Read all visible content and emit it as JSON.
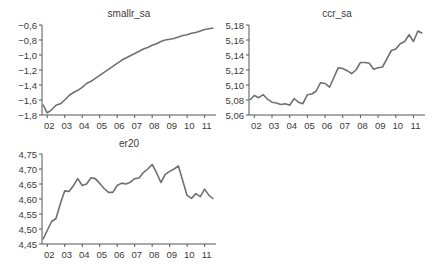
{
  "figure": {
    "panels": [
      {
        "id": "smallr_sa",
        "title": "smallr_sa"
      },
      {
        "id": "ccr_sa",
        "title": "ccr_sa"
      },
      {
        "id": "er20",
        "title": "er20"
      }
    ]
  },
  "chart_data": [
    {
      "type": "line",
      "title": "smallr_sa",
      "xlabel": "",
      "ylabel": "",
      "x_tick_labels": [
        "02",
        "03",
        "04",
        "05",
        "06",
        "07",
        "08",
        "09",
        "10",
        "11"
      ],
      "y_tick_labels": [
        "-0,6",
        "-0,8",
        "-1,0",
        "-1,2",
        "-1,4",
        "-1,6",
        "-1,8"
      ],
      "ylim": [
        -1.8,
        -0.6
      ],
      "grid": false,
      "x": [
        2001.75,
        2002.0,
        2002.25,
        2002.5,
        2002.75,
        2003.0,
        2003.25,
        2003.5,
        2003.75,
        2004.0,
        2004.25,
        2004.5,
        2004.75,
        2005.0,
        2005.25,
        2005.5,
        2005.75,
        2006.0,
        2006.25,
        2006.5,
        2006.75,
        2007.0,
        2007.25,
        2007.5,
        2007.75,
        2008.0,
        2008.25,
        2008.5,
        2008.75,
        2009.0,
        2009.25,
        2009.5,
        2009.75,
        2010.0,
        2010.25,
        2010.5,
        2010.75,
        2011.0,
        2011.25,
        2011.5
      ],
      "values": [
        -1.66,
        -1.77,
        -1.73,
        -1.67,
        -1.65,
        -1.6,
        -1.54,
        -1.5,
        -1.47,
        -1.43,
        -1.38,
        -1.35,
        -1.31,
        -1.27,
        -1.23,
        -1.19,
        -1.15,
        -1.11,
        -1.07,
        -1.04,
        -1.01,
        -0.98,
        -0.95,
        -0.92,
        -0.9,
        -0.87,
        -0.85,
        -0.82,
        -0.8,
        -0.79,
        -0.78,
        -0.76,
        -0.74,
        -0.73,
        -0.71,
        -0.7,
        -0.68,
        -0.66,
        -0.65,
        -0.64
      ]
    },
    {
      "type": "line",
      "title": "ccr_sa",
      "xlabel": "",
      "ylabel": "",
      "x_tick_labels": [
        "02",
        "03",
        "04",
        "05",
        "06",
        "07",
        "08",
        "09",
        "10",
        "11"
      ],
      "y_tick_labels": [
        "5,18",
        "5,16",
        "5,14",
        "5,12",
        "5,10",
        "5,08",
        "5,06"
      ],
      "ylim": [
        5.06,
        5.18
      ],
      "grid": false,
      "x": [
        2001.75,
        2002.0,
        2002.25,
        2002.5,
        2002.75,
        2003.0,
        2003.25,
        2003.5,
        2003.75,
        2004.0,
        2004.25,
        2004.5,
        2004.75,
        2005.0,
        2005.25,
        2005.5,
        2005.75,
        2006.0,
        2006.25,
        2006.5,
        2006.75,
        2007.0,
        2007.25,
        2007.5,
        2007.75,
        2008.0,
        2008.25,
        2008.5,
        2008.75,
        2009.0,
        2009.25,
        2009.5,
        2009.75,
        2010.0,
        2010.25,
        2010.5,
        2010.75,
        2011.0,
        2011.25,
        2011.5
      ],
      "values": [
        5.08,
        5.086,
        5.083,
        5.087,
        5.081,
        5.077,
        5.076,
        5.074,
        5.075,
        5.073,
        5.082,
        5.077,
        5.075,
        5.087,
        5.088,
        5.092,
        5.103,
        5.102,
        5.097,
        5.11,
        5.123,
        5.122,
        5.119,
        5.115,
        5.12,
        5.13,
        5.13,
        5.129,
        5.121,
        5.123,
        5.124,
        5.135,
        5.146,
        5.148,
        5.155,
        5.158,
        5.167,
        5.158,
        5.172,
        5.169
      ]
    },
    {
      "type": "line",
      "title": "er20",
      "xlabel": "",
      "ylabel": "",
      "x_tick_labels": [
        "02",
        "03",
        "04",
        "05",
        "06",
        "07",
        "08",
        "09",
        "10",
        "11"
      ],
      "y_tick_labels": [
        "4,75",
        "4,70",
        "4,65",
        "4,60",
        "4,55",
        "4,50",
        "4,45"
      ],
      "ylim": [
        4.45,
        4.75
      ],
      "grid": false,
      "x": [
        2001.75,
        2002.0,
        2002.25,
        2002.5,
        2002.75,
        2003.0,
        2003.25,
        2003.5,
        2003.75,
        2004.0,
        2004.25,
        2004.5,
        2004.75,
        2005.0,
        2005.25,
        2005.5,
        2005.75,
        2006.0,
        2006.25,
        2006.5,
        2006.75,
        2007.0,
        2007.25,
        2007.5,
        2007.75,
        2008.0,
        2008.25,
        2008.5,
        2008.75,
        2009.0,
        2009.25,
        2009.5,
        2009.75,
        2010.0,
        2010.25,
        2010.5,
        2010.75,
        2011.0,
        2011.25,
        2011.5
      ],
      "values": [
        4.465,
        4.495,
        4.525,
        4.535,
        4.585,
        4.627,
        4.625,
        4.645,
        4.668,
        4.645,
        4.65,
        4.671,
        4.668,
        4.652,
        4.635,
        4.622,
        4.622,
        4.645,
        4.653,
        4.65,
        4.656,
        4.668,
        4.67,
        4.688,
        4.7,
        4.715,
        4.688,
        4.655,
        4.682,
        4.692,
        4.7,
        4.71,
        4.66,
        4.612,
        4.602,
        4.618,
        4.608,
        4.633,
        4.612,
        4.6
      ]
    }
  ]
}
